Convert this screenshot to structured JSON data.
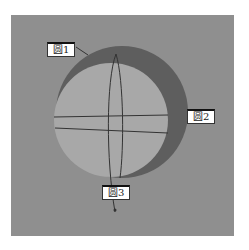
{
  "labels": {
    "circle1": "圆1",
    "circle2": "圆2",
    "circle3": "圆3"
  },
  "colors": {
    "background": "#8f8f8f",
    "sphere_light": "#a8a8a8",
    "sphere_dark": "#5e5e5e",
    "lines": "#333333"
  }
}
